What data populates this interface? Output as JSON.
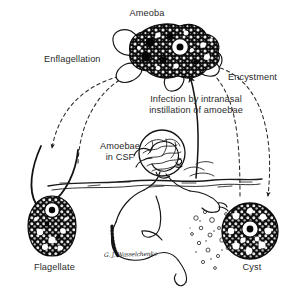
{
  "figure": {
    "title": "Ameoba",
    "background_color": "#ffffff",
    "ink_color": "#1a1a1a",
    "text_color": "#2b2b2b",
    "width": 294,
    "height": 292
  },
  "labels": {
    "ameoba": "Ameoba",
    "enflagellation": "Enflagellation",
    "encystment": "Encystment",
    "infection_line1": "Infection by intranasal",
    "infection_line2": "instillation of amoebae",
    "amoebae_in_csf_line1": "Amoebae",
    "amoebae_in_csf_line2": "in CSF",
    "flagellate": "Flagellate",
    "cyst": "Cyst",
    "signature": "G. J. Wasselchenko"
  },
  "stages": [
    {
      "name": "ameoba",
      "label": "Ameoba",
      "shape": "irregular-pseudopod-blob",
      "fill": "#111111",
      "nucleus": "white ring with black karyosome",
      "position": "top-center"
    },
    {
      "name": "flagellate",
      "label": "Flagellate",
      "shape": "pear-shaped-body-with-two-flagella",
      "fill": "#111111",
      "nucleus": "white ring with black karyosome",
      "position": "bottom-left"
    },
    {
      "name": "cyst",
      "label": "Cyst",
      "shape": "round-thick-walled-sphere",
      "fill": "#111111",
      "nucleus": "white ring with black karyosome",
      "position": "bottom-right"
    },
    {
      "name": "brain",
      "label": "Amoebae in CSF",
      "shape": "human-brain-sagittal",
      "fill": "#ffffff",
      "position": "center"
    },
    {
      "name": "swimmer",
      "label": "",
      "shape": "person-diving-into-water",
      "fill": "#ffffff",
      "position": "center-bottom"
    }
  ],
  "arrows": [
    {
      "name": "flagellate-to-ameoba",
      "style": "dashed",
      "label": "Enflagellation",
      "from": "flagellate",
      "to": "ameoba"
    },
    {
      "name": "ameoba-to-flagellate",
      "style": "dashed",
      "label": "",
      "from": "ameoba",
      "to": "flagellate"
    },
    {
      "name": "ameoba-to-cyst",
      "style": "dashed",
      "label": "Encystment",
      "from": "ameoba",
      "to": "cyst"
    },
    {
      "name": "cyst-to-ameoba",
      "style": "dashed",
      "label": "",
      "from": "cyst",
      "to": "ameoba"
    },
    {
      "name": "swimmer-to-ameoba",
      "style": "solid",
      "label": "Infection by intranasal instillation of amoebae",
      "from": "swimmer",
      "to": "ameoba"
    }
  ]
}
